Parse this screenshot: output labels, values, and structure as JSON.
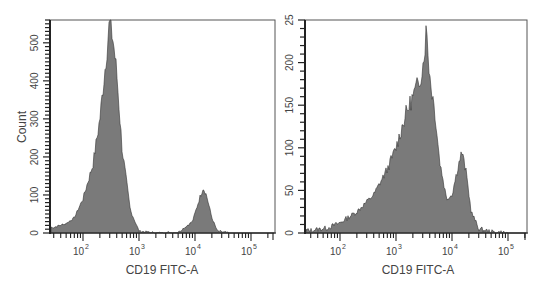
{
  "chart_data": [
    {
      "type": "area",
      "title": "",
      "xlabel": "CD19 FITC-A",
      "ylabel": "Count",
      "xscale": "log",
      "xticks": [
        "10^2",
        "10^3",
        "10^4",
        "10^5"
      ],
      "yticks": [
        0,
        100,
        200,
        300,
        400,
        500
      ],
      "ylim": [
        0,
        560
      ],
      "grid": false,
      "fill_color": "#7a7a7a",
      "series": [
        {
          "name": "Histogram",
          "x": [
            30,
            50,
            70,
            100,
            150,
            200,
            250,
            300,
            350,
            400,
            500,
            700,
            1000,
            2000,
            5000,
            9000,
            12000,
            14000,
            16000,
            20000,
            25000,
            40000,
            100000,
            200000
          ],
          "values": [
            15,
            25,
            40,
            90,
            180,
            300,
            440,
            560,
            500,
            420,
            220,
            60,
            5,
            0,
            2,
            30,
            90,
            120,
            100,
            40,
            5,
            0,
            0,
            0
          ]
        }
      ]
    },
    {
      "type": "area",
      "title": "",
      "xlabel": "CD19 FITC-A",
      "ylabel": "",
      "xscale": "log",
      "xticks": [
        "10^2",
        "10^3",
        "10^4",
        "10^5"
      ],
      "yticks": [
        0,
        50,
        100,
        150,
        200,
        250
      ],
      "ytick_labels": [
        "0",
        "50",
        "100",
        "150",
        "200",
        "25"
      ],
      "ylim": [
        0,
        250
      ],
      "grid": false,
      "fill_color": "#7a7a7a",
      "series": [
        {
          "name": "Histogram",
          "x": [
            30,
            60,
            100,
            200,
            400,
            700,
            1000,
            1500,
            2000,
            2500,
            3000,
            3500,
            4000,
            5000,
            6000,
            8000,
            10000,
            13000,
            15000,
            18000,
            22000,
            30000,
            50000,
            100000,
            200000
          ],
          "values": [
            3,
            6,
            12,
            25,
            45,
            75,
            100,
            140,
            160,
            175,
            195,
            240,
            185,
            140,
            85,
            40,
            45,
            80,
            95,
            70,
            25,
            5,
            1,
            0,
            0
          ]
        }
      ]
    }
  ],
  "left_panel": {
    "ylabel": "Count",
    "xlabel": "CD19 FITC-A",
    "ytick_labels": [
      "0",
      "100",
      "200",
      "300",
      "400",
      "500"
    ],
    "xtick_labels": [
      {
        "base": "10",
        "exp": "2"
      },
      {
        "base": "10",
        "exp": "3"
      },
      {
        "base": "10",
        "exp": "4"
      },
      {
        "base": "10",
        "exp": "5"
      }
    ]
  },
  "right_panel": {
    "xlabel": "CD19 FITC-A",
    "ytick_labels": [
      "0",
      "50",
      "100",
      "150",
      "200",
      "25"
    ],
    "xtick_labels": [
      {
        "base": "10",
        "exp": "2"
      },
      {
        "base": "10",
        "exp": "3"
      },
      {
        "base": "10",
        "exp": "4"
      },
      {
        "base": "10",
        "exp": "5"
      }
    ]
  }
}
